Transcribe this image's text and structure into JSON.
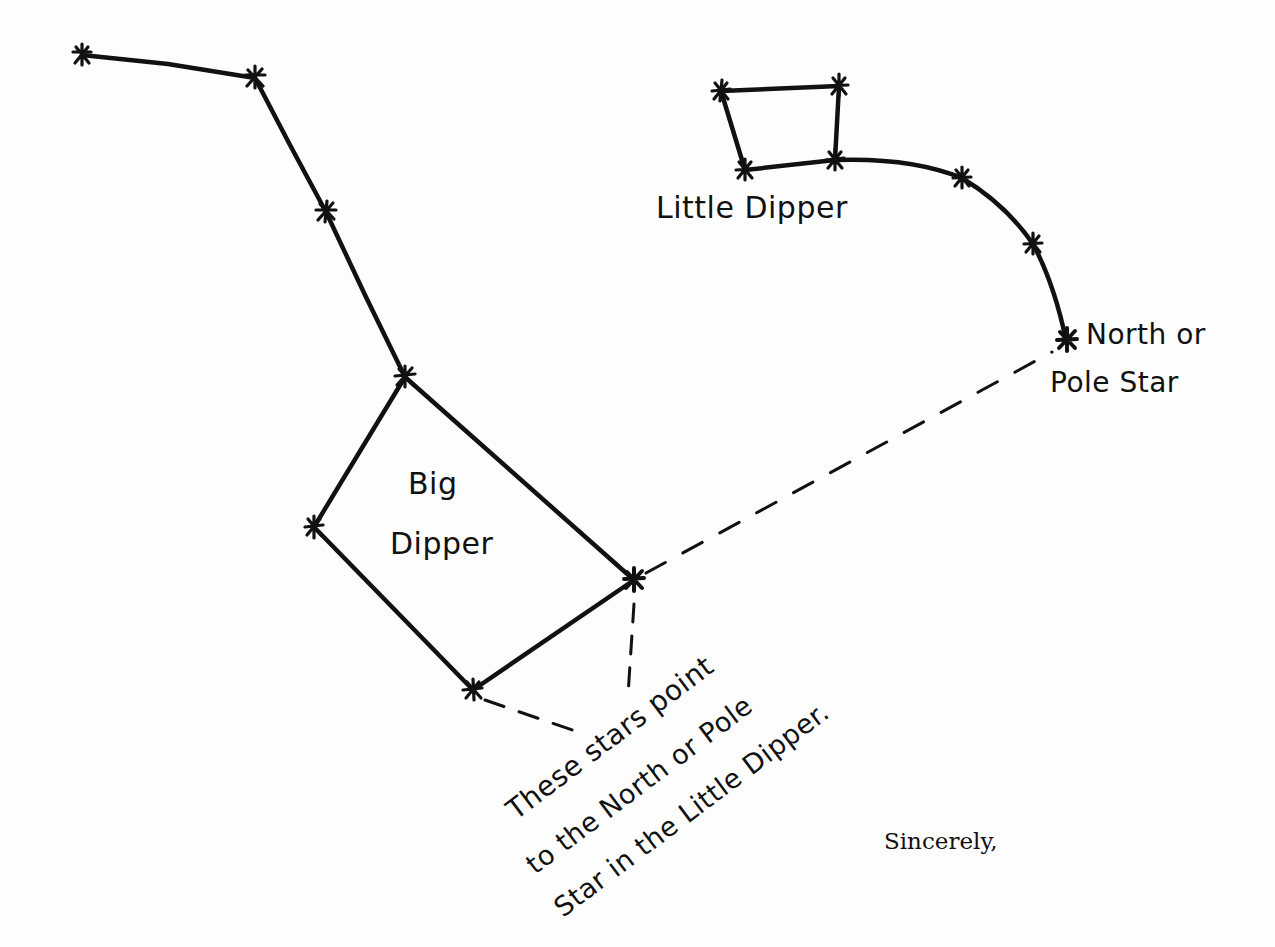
{
  "labels": {
    "big_dipper_line1": "Big",
    "big_dipper_line2": "Dipper",
    "little_dipper": "Little Dipper",
    "north_star_line1": "North or",
    "north_star_line2": "Pole Star",
    "note_line1": "These stars point",
    "note_line2": "to the North or Pole",
    "note_line3": "Star in the Little Dipper.",
    "closing": "Sincerely,"
  },
  "colors": {
    "ink": "#111111",
    "paper": "#fdfdfd"
  },
  "constellations": {
    "big_dipper": {
      "stars": [
        [
          82,
          55
        ],
        [
          255,
          78
        ],
        [
          326,
          212
        ],
        [
          405,
          377
        ],
        [
          314,
          527
        ],
        [
          473,
          690
        ],
        [
          634,
          580
        ]
      ],
      "pointer_stars": [
        [
          634,
          580
        ],
        [
          473,
          690
        ]
      ]
    },
    "little_dipper": {
      "stars": [
        [
          721,
          91
        ],
        [
          839,
          86
        ],
        [
          835,
          160
        ],
        [
          745,
          170
        ],
        [
          962,
          178
        ],
        [
          1033,
          244
        ],
        [
          1066,
          340
        ]
      ],
      "pole_star": [
        1066,
        340
      ]
    }
  }
}
